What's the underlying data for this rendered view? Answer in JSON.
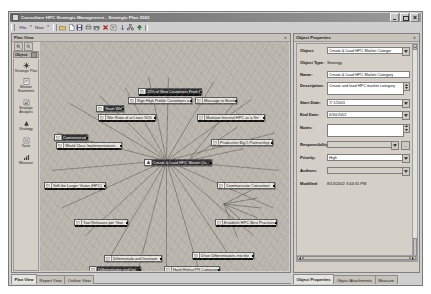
{
  "window": {
    "title": "Consultare HPC Strategic Management - Strategic Plan 2002",
    "icon": "app-icon",
    "minimize": "–",
    "maximize": "□",
    "close": "×"
  },
  "menubar": {
    "items": [
      {
        "label": "File",
        "arrow": "▾"
      },
      {
        "label": "New",
        "arrow": "▾"
      }
    ]
  },
  "toolbar": {
    "buttons": [
      {
        "name": "open-folder-icon"
      },
      {
        "name": "new-document-icon"
      },
      {
        "name": "save-icon"
      },
      {
        "name": "print-preview-icon"
      },
      {
        "name": "print-icon"
      },
      {
        "name": "delete-icon"
      },
      {
        "name": "properties-icon"
      },
      {
        "name": "link-icon"
      },
      {
        "name": "hierarchy-icon"
      },
      {
        "name": "promote-icon"
      }
    ]
  },
  "left_pane": {
    "header": "Plan View",
    "close": "×",
    "zoom": {
      "in": "zoom-in-icon",
      "out": "zoom-out-icon"
    },
    "object_bar": {
      "label": "Object",
      "pin": "■"
    },
    "palette": [
      {
        "label": "Strategic Plan",
        "icon": "strategic-plan-icon"
      },
      {
        "label": "Mission Statement",
        "icon": "mission-statement-icon"
      },
      {
        "label": "Strategic Analysis",
        "icon": "strategic-analysis-icon"
      },
      {
        "label": "Strategy",
        "icon": "strategy-icon"
      },
      {
        "label": "Tactic",
        "icon": "tactic-icon"
      },
      {
        "label": "Measure",
        "icon": "measure-icon"
      }
    ]
  },
  "diagram": {
    "center_node": "Create & Lead HPC Market Ca",
    "nodes": [
      {
        "label": "25% of New Customers From R",
        "x": 126,
        "y": 54,
        "w": 64,
        "sel": true,
        "bar": true
      },
      {
        "label": "Sign High Profile Customers a",
        "x": 116,
        "y": 63,
        "w": 64,
        "sel": false,
        "bar": false
      },
      {
        "label": "Message to Existing",
        "x": 183,
        "y": 63,
        "w": 42,
        "sel": false,
        "bar": false
      },
      {
        "label": "Team Well D",
        "x": 84,
        "y": 71,
        "w": 28,
        "sel": true,
        "bar": false
      },
      {
        "label": "Win Ratio of at Least 50%",
        "x": 86,
        "y": 80,
        "w": 58,
        "sel": false,
        "bar": true
      },
      {
        "label": "Maintain Internal HPC as a Str",
        "x": 185,
        "y": 80,
        "w": 68,
        "sel": false,
        "bar": true
      },
      {
        "label": "Communicate",
        "x": 42,
        "y": 100,
        "w": 34,
        "sel": true,
        "bar": false
      },
      {
        "label": "World Class Implementations",
        "x": 44,
        "y": 108,
        "w": 66,
        "sel": false,
        "bar": true
      },
      {
        "label": "Productive Big 5 Partnership",
        "x": 199,
        "y": 105,
        "w": 62,
        "sel": false,
        "bar": false
      },
      {
        "label": "Sell the Larger Vision (HPC)",
        "x": 32,
        "y": 148,
        "w": 62,
        "sel": false,
        "bar": true
      },
      {
        "label": "Communicate Consistent",
        "x": 205,
        "y": 148,
        "w": 58,
        "sel": false,
        "bar": false
      },
      {
        "label": "Two Releases per Year",
        "x": 62,
        "y": 185,
        "w": 54,
        "sel": false,
        "bar": true
      },
      {
        "label": "Establish HPC Best Practices",
        "x": 203,
        "y": 185,
        "w": 62,
        "sel": false,
        "bar": true
      },
      {
        "label": "Differentiate and Innovate",
        "x": 92,
        "y": 221,
        "w": 58,
        "sel": false,
        "bar": false
      },
      {
        "label": "Drive Differentiators into the",
        "x": 180,
        "y": 218,
        "w": 62,
        "sel": false,
        "bar": true
      },
      {
        "label": "Differentiation and Inn",
        "x": 77,
        "y": 232,
        "w": 52,
        "sel": true,
        "bar": true
      },
      {
        "label": "Hard Hitting PR Campaign",
        "x": 152,
        "y": 232,
        "w": 56,
        "sel": false,
        "bar": false
      },
      {
        "label": "ated Document Co",
        "x": 196,
        "y": 237,
        "w": 46,
        "sel": true,
        "bar": true
      },
      {
        "label": "20 Public Speaking Engagem",
        "x": 122,
        "y": 247,
        "w": 62,
        "sel": true,
        "bar": true
      },
      {
        "label": "Turing Consultant",
        "x": 186,
        "y": 247,
        "w": 42,
        "sel": true,
        "bar": false
      }
    ]
  },
  "bottom_tabs": {
    "left": [
      "Plan View",
      "Report View",
      "Outline View"
    ],
    "left_active": "Plan View",
    "right": [
      "Object Properties",
      "Object Attachments",
      "Measure"
    ],
    "right_active": "Object Properties"
  },
  "properties": {
    "header": "Object Properties",
    "close": "×",
    "fields": {
      "object_label": "Object:",
      "object_value": "Create & Lead HPC Market Categor",
      "object_type_label": "Object Type:",
      "object_type_value": "Strategy",
      "name_label": "Name:",
      "name_value": "Create & Lead HPC Market Category",
      "description_label": "Description:",
      "description_value": "Create and lead HPC market category",
      "start_date_label": "Start Date:",
      "start_date_value": "7/ 1/2001",
      "end_date_label": "End Date:",
      "end_date_value": "6/30/2002",
      "notes_label": "Notes:",
      "notes_value": "",
      "responsibility_label": "Responsibility:",
      "responsibility_value": "",
      "priority_label": "Priority:",
      "priority_value": "High",
      "authors_label": "Authors:",
      "authors_value": "",
      "modified_label": "Modified:",
      "modified_value": "8/13/2002 3:44:31 PM",
      "ellipsis": "..."
    }
  },
  "colors": {
    "title_bar": "#6b6b6b",
    "panel_face": "#d4d0c8",
    "canvas": "#b9b5ad",
    "selected_node": "#2e2e2e"
  }
}
